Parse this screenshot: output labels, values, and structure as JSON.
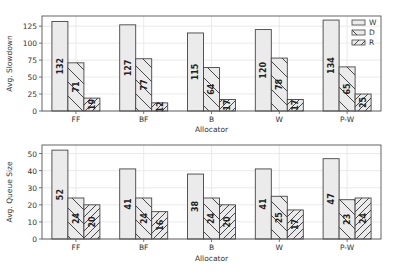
{
  "chart_data": [
    {
      "type": "bar",
      "title": "",
      "xlabel": "Allocator",
      "ylabel": "Avg. Slowdown",
      "categories": [
        "FF",
        "BF",
        "B",
        "W",
        "P-W"
      ],
      "series": [
        {
          "name": "W",
          "values": [
            132,
            127,
            115,
            120,
            134
          ],
          "labels": [
            "132",
            "127",
            "115",
            "120",
            "134"
          ]
        },
        {
          "name": "D",
          "values": [
            71,
            77,
            64,
            78,
            65
          ],
          "labels": [
            "71",
            "77",
            "64",
            "78",
            "65"
          ]
        },
        {
          "name": "R",
          "values": [
            19,
            12,
            17,
            17,
            25
          ],
          "labels": [
            "19",
            "12",
            "17",
            "17",
            "25"
          ]
        }
      ],
      "ylim": [
        0,
        140
      ],
      "yticks": [
        0,
        25,
        50,
        75,
        100,
        125
      ],
      "grid": true,
      "legend_position": "upper right"
    },
    {
      "type": "bar",
      "title": "",
      "xlabel": "Allocator",
      "ylabel": "Avg. Queue Size",
      "categories": [
        "FF",
        "BF",
        "B",
        "W",
        "P-W"
      ],
      "series": [
        {
          "name": "W",
          "values": [
            52,
            41,
            38,
            41,
            47
          ],
          "labels": [
            "52",
            "41",
            "38",
            "41",
            "47"
          ]
        },
        {
          "name": "D",
          "values": [
            24,
            24,
            24,
            25,
            23
          ],
          "labels": [
            "24",
            "24",
            "24",
            "25",
            "23"
          ]
        },
        {
          "name": "R",
          "values": [
            20,
            16,
            20,
            17,
            24
          ],
          "labels": [
            "20",
            "16",
            "20",
            "17",
            "24"
          ]
        }
      ],
      "ylim": [
        0,
        55
      ],
      "yticks": [
        0,
        10,
        20,
        30,
        40,
        50
      ],
      "grid": true,
      "legend_position": "none"
    }
  ],
  "colors": {
    "bar_fill": "#ebebeb",
    "bar_edge": "#444444",
    "hatch": "#333333",
    "grid": "#e4e4e4",
    "axis": "#555555",
    "text": "#333333"
  },
  "legend": {
    "items": [
      {
        "label": "W",
        "hatch": "none"
      },
      {
        "label": "D",
        "hatch": "backslash"
      },
      {
        "label": "R",
        "hatch": "slash"
      }
    ]
  }
}
